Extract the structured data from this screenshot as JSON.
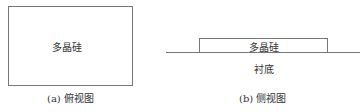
{
  "top_view": {
    "material_label": "多晶硅",
    "caption": "(a) 俯视图"
  },
  "side_view": {
    "material_label": "多晶硅",
    "substrate_label": "衬底",
    "caption": "(b) 侧视图"
  },
  "colors": {
    "line": "#777777",
    "text": "#333333"
  }
}
